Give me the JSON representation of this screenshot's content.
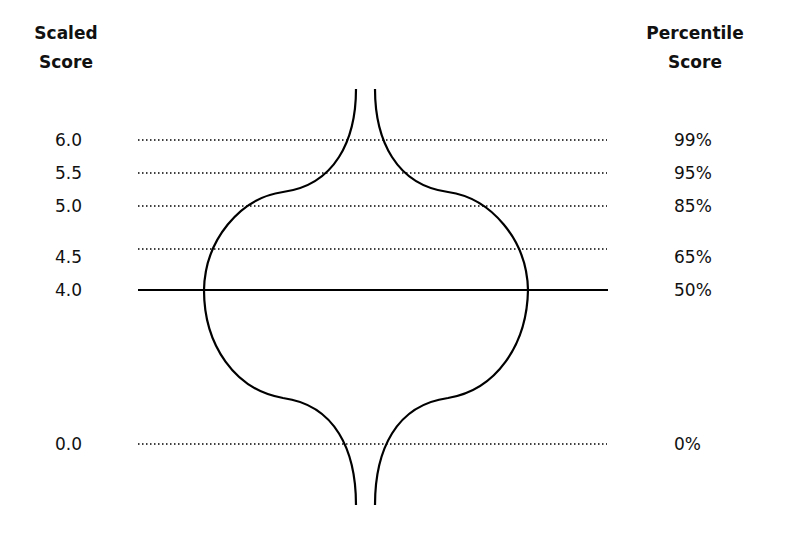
{
  "headers": {
    "left": {
      "line1": "Scaled",
      "line2": "Score"
    },
    "right": {
      "line1": "Percentile",
      "line2": "Score"
    }
  },
  "rows": [
    {
      "scaled": "6.0",
      "percentile": "99%",
      "y": 140,
      "style": "dotted"
    },
    {
      "scaled": "5.5",
      "percentile": "95%",
      "y": 173,
      "style": "dotted"
    },
    {
      "scaled": "5.0",
      "percentile": "85%",
      "y": 206,
      "style": "dotted"
    },
    {
      "scaled": "4.5",
      "percentile": "65%",
      "y": 249,
      "style": "dotted"
    },
    {
      "scaled": "4.0",
      "percentile": "50%",
      "y": 290,
      "style": "solid"
    },
    {
      "scaled": "0.0",
      "percentile": "0%",
      "y": 444,
      "style": "dotted"
    }
  ],
  "shape": {
    "description": "vase/onion-shaped distribution outline symmetric around center, narrow stems at top and bottom",
    "stroke_color": "#000000"
  },
  "colors": {
    "background": "#ffffff",
    "text": "#111111",
    "line": "#000000"
  }
}
